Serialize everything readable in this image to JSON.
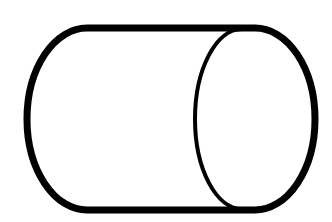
{
  "diagram": {
    "shape": "cylinder",
    "orientation": "horizontal",
    "stroke_color": "#000000",
    "fill_color": "#ffffff",
    "background": "#ffffff"
  }
}
